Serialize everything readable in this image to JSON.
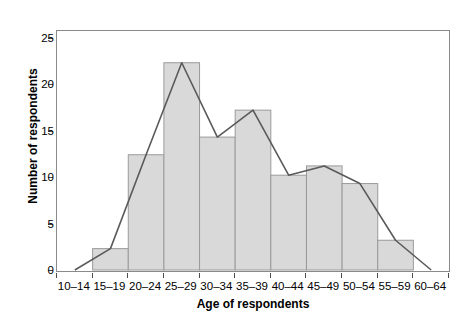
{
  "chart_data": {
    "type": "bar",
    "title": "",
    "xlabel": "Age of respondents",
    "ylabel": "Number of respondents",
    "categories": [
      "10–14",
      "15–19",
      "20–24",
      "25–29",
      "30–34",
      "35–39",
      "40–44",
      "45–49",
      "50–54",
      "55–59",
      "60–64"
    ],
    "values": [
      0,
      2.3,
      12.4,
      22.3,
      14.3,
      17.2,
      10.2,
      11.2,
      9.3,
      3.2,
      0
    ],
    "bar_categories": [
      "15–19",
      "20–24",
      "25–29",
      "30–34",
      "35–39",
      "40–44",
      "45–49",
      "50–54",
      "55–59"
    ],
    "bar_values": [
      2.3,
      12.4,
      22.3,
      14.3,
      17.2,
      10.2,
      11.2,
      9.3,
      3.2
    ],
    "overlay": {
      "type": "line",
      "name": "frequency polygon",
      "x": [
        "10–14",
        "15–19",
        "20–24",
        "25–29",
        "30–34",
        "35–39",
        "40–44",
        "45–49",
        "50–54",
        "55–59",
        "60–64"
      ],
      "values": [
        0,
        2.3,
        12.4,
        22.3,
        14.3,
        17.2,
        10.2,
        11.2,
        9.3,
        3.2,
        0
      ]
    },
    "yticks": [
      0,
      5,
      10,
      15,
      20,
      25
    ],
    "ylim": [
      0,
      25.5
    ],
    "xtick_labels": [
      "10–14",
      "15–19",
      "20–24",
      "25–29",
      "30–34",
      "35–39",
      "40–44",
      "45–49",
      "50–54",
      "55–59",
      "60–64"
    ],
    "grid": false,
    "legend": "none",
    "colors": {
      "bar_fill": "#d9d9d9",
      "bar_stroke": "#9a9a9a",
      "line": "#5a5a5a",
      "axis": "#8a8a8a",
      "text": "#000000",
      "background": "#ffffff"
    }
  },
  "axes": {
    "y_title": "Number of respondents",
    "x_title": "Age of respondents"
  }
}
